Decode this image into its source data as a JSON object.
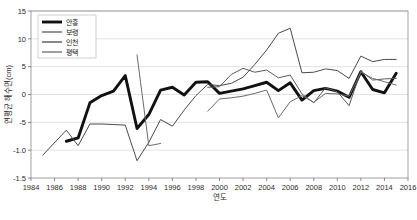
{
  "chart_data": {
    "type": "line",
    "title": "",
    "xlabel": "연도",
    "ylabel": "연평균 해수면(cm)",
    "xlim": [
      1984,
      2016
    ],
    "ylim": [
      -15,
      15
    ],
    "grid": true,
    "legend_position": "top-left",
    "xticks": [
      1984,
      1986,
      1988,
      1990,
      1992,
      1994,
      1996,
      1998,
      2000,
      2002,
      2004,
      2006,
      2008,
      2010,
      2012,
      2014,
      2016
    ],
    "xtick_labels": [
      "1984",
      "1986",
      "1988",
      "1990",
      "1992",
      "1994",
      "1996",
      "1998",
      "2000",
      "2002",
      "2004",
      "2006",
      "2008",
      "2010",
      "2012",
      "2014",
      "2016"
    ],
    "yticks": [
      -15,
      -10,
      -5,
      0,
      5,
      10,
      15
    ],
    "ytick_labels": [
      "-1.5",
      "-1.0",
      "-5",
      "0",
      "5",
      "10",
      "15"
    ],
    "series": [
      {
        "name": "안흥",
        "color": "#111111",
        "width": 2.9,
        "x": [
          1987,
          1988,
          1989,
          1990,
          1991,
          1992,
          1993,
          1994,
          1995,
          1996,
          1997,
          1998,
          1999,
          2000,
          2001,
          2002,
          2003,
          2004,
          2005,
          2006,
          2007,
          2008,
          2009,
          2010,
          2011,
          2012,
          2013,
          2014,
          2015
        ],
        "values": [
          -8.4,
          -7.8,
          -1.5,
          -0.2,
          0.6,
          3.4,
          -6.1,
          -3.6,
          0.8,
          1.3,
          -0.1,
          2.2,
          2.3,
          0.2,
          0.6,
          1.0,
          1.6,
          2.2,
          0.7,
          2.1,
          -1.0,
          0.7,
          1.1,
          0.6,
          -0.5,
          4.1,
          0.9,
          0.3,
          3.8
        ]
      },
      {
        "name": "보령",
        "color": "#5a5a5a",
        "width": 1.0,
        "x": [
          1999,
          2000,
          2001,
          2002,
          2003,
          2004,
          2005,
          2006,
          2007,
          2008,
          2009,
          2010,
          2011,
          2012,
          2013,
          2014,
          2015
        ],
        "values": [
          1.3,
          1.4,
          3.6,
          4.7,
          4.0,
          4.4,
          3.0,
          3.5,
          0.1,
          -1.5,
          1.2,
          0.5,
          -2.0,
          4.2,
          2.6,
          2.8,
          2.9
        ]
      },
      {
        "name": "인천",
        "color": "#4a4a4a",
        "width": 1.0,
        "x": [
          1985,
          1987,
          1988,
          1989,
          1990,
          1991,
          1992,
          1993,
          1994,
          1995,
          1996,
          1997,
          1998,
          1999,
          2000,
          2001,
          2002,
          2003,
          2004,
          2005,
          2006,
          2007,
          2008,
          2009,
          2010,
          2011,
          2012,
          2013,
          2014,
          2015
        ],
        "values": [
          -10.9,
          -6.4,
          -9.2,
          -5.3,
          -5.3,
          -5.4,
          -5.5,
          -11.9,
          -8.6,
          -4.5,
          -5.7,
          -2.8,
          -0.2,
          1.8,
          1.6,
          2.0,
          3.1,
          5.4,
          8.0,
          11.0,
          11.9,
          3.9,
          4.0,
          4.6,
          4.3,
          2.9,
          6.9,
          5.9,
          6.3,
          6.3
        ]
      },
      {
        "name": "평택",
        "color": "#6b6b6b",
        "width": 1.0,
        "x": [
          1993,
          1994,
          1995
        ],
        "values": [
          7.1,
          -9.2,
          -8.8
        ]
      },
      {
        "name": "평택-2",
        "color": "#6b6b6b",
        "width": 1.0,
        "x": [
          1999,
          2000,
          2001,
          2002,
          2003,
          2004,
          2005,
          2006,
          2007,
          2008,
          2009,
          2010,
          2011,
          2012,
          2013,
          2014,
          2015
        ],
        "values": [
          -3.0,
          -0.8,
          -0.6,
          -0.3,
          0.2,
          0.8,
          -4.2,
          -1.3,
          -0.2,
          -1.4,
          0.2,
          0.1,
          -0.3,
          4.0,
          2.9,
          2.3,
          1.7
        ]
      }
    ],
    "legend_entries": [
      {
        "label": "안흥",
        "color": "#111111",
        "width": 2.9
      },
      {
        "label": "보령",
        "color": "#5a5a5a",
        "width": 1.3
      },
      {
        "label": "인천",
        "color": "#4a4a4a",
        "width": 1.3
      },
      {
        "label": "평택",
        "color": "#6b6b6b",
        "width": 1.3
      }
    ]
  }
}
